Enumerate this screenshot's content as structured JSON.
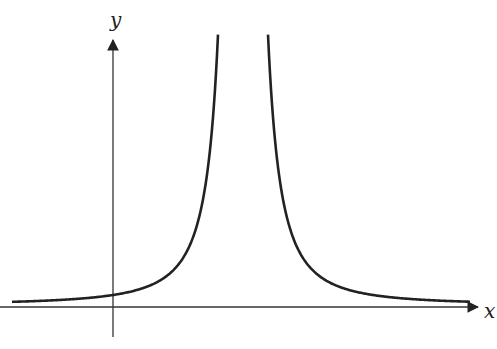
{
  "chart_data": {
    "type": "line",
    "title": "",
    "xlabel": "x",
    "ylabel": "y",
    "grid": false,
    "legend": null,
    "asymptote_x_px": 243,
    "series": [
      {
        "name": "left branch",
        "x_px_range": [
          12,
          218
        ]
      },
      {
        "name": "right branch",
        "x_px_range": [
          268,
          470
        ]
      }
    ]
  },
  "axes": {
    "x_label": "x",
    "y_label": "y"
  },
  "style": {
    "line_color": "#222222",
    "axis_color": "#333333"
  }
}
